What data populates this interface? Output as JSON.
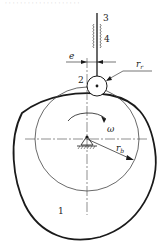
{
  "diagram": {
    "top_caption": "· · · · · · · · ·   · · · · · · · · · · ·",
    "labels": {
      "cam": "1",
      "roller": "2",
      "follower": "3",
      "guide": "4",
      "offset": "e",
      "roller_radius": "r",
      "roller_radius_sub": "r",
      "base_radius": "r",
      "base_radius_sub": "b",
      "angular_velocity": "ω"
    },
    "colors": {
      "line": "#1a1a1a",
      "thin_line": "#444444",
      "background": "#ffffff"
    }
  }
}
